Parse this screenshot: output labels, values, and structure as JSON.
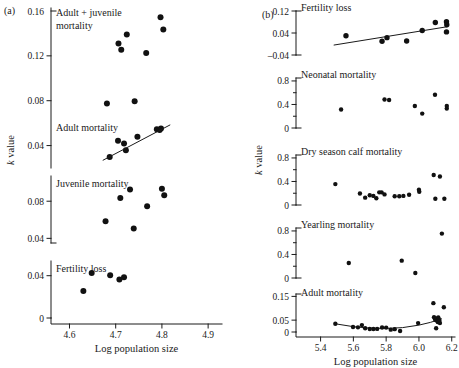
{
  "figure": {
    "panel_a_letter": "(a)",
    "panel_b_letter": "(b)",
    "y_axis_label_a": "k value",
    "y_axis_label_b": "k value",
    "x_axis_label_a": "Log population size",
    "x_axis_label_b": "Log population size"
  },
  "chart_data": [
    {
      "type": "scatter",
      "panel": "(a)",
      "title": "Adult + juvenile mortality",
      "xlabel": "Log population size",
      "ylabel": "k value",
      "xlim": [
        4.56,
        4.93
      ],
      "ylim": [
        0.02,
        0.16
      ],
      "xticks": [
        4.6,
        4.7,
        4.8,
        4.9
      ],
      "xtick_labels": [
        "4.6",
        "4.7",
        "4.8",
        "4.9"
      ],
      "yticks": [
        0.04,
        0.08,
        0.12,
        0.16
      ],
      "ytick_labels": [
        "0.04",
        "0.08",
        "0.12",
        "0.16"
      ],
      "grid": false,
      "legend": "none",
      "points": [
        {
          "x": 4.681,
          "y": 0.0775
        },
        {
          "x": 4.706,
          "y": 0.131
        },
        {
          "x": 4.712,
          "y": 0.1255
        },
        {
          "x": 4.724,
          "y": 0.139
        },
        {
          "x": 4.741,
          "y": 0.0795
        },
        {
          "x": 4.766,
          "y": 0.1225
        },
        {
          "x": 4.797,
          "y": 0.1545
        },
        {
          "x": 4.803,
          "y": 0.1435
        }
      ]
    },
    {
      "type": "scatter",
      "panel": "(a)",
      "title": "Adult mortality",
      "xlabel": "Log population size",
      "ylabel": "k value",
      "xlim": [
        4.56,
        4.93
      ],
      "ylim": [
        0.02,
        0.16
      ],
      "grid": false,
      "legend": "none",
      "trendline": {
        "x0": 4.672,
        "y0": 0.0268,
        "x1": 4.818,
        "y1": 0.0585
      },
      "points": [
        {
          "x": 4.687,
          "y": 0.0297
        },
        {
          "x": 4.705,
          "y": 0.0443
        },
        {
          "x": 4.718,
          "y": 0.0418
        },
        {
          "x": 4.722,
          "y": 0.0358
        },
        {
          "x": 4.747,
          "y": 0.0478
        },
        {
          "x": 4.789,
          "y": 0.0545
        },
        {
          "x": 4.795,
          "y": 0.0538
        },
        {
          "x": 4.798,
          "y": 0.0552
        }
      ]
    },
    {
      "type": "scatter",
      "panel": "(a)",
      "title": "Juvenile mortality",
      "xlabel": "Log population size",
      "ylabel": "k value",
      "xlim": [
        4.56,
        4.93
      ],
      "ylim": [
        0.04,
        0.105
      ],
      "yticks": [
        0.04,
        0.08
      ],
      "ytick_labels": [
        "0.04",
        "0.08"
      ],
      "grid": false,
      "legend": "none",
      "points": [
        {
          "x": 4.678,
          "y": 0.0585
        },
        {
          "x": 4.71,
          "y": 0.0835
        },
        {
          "x": 4.731,
          "y": 0.0925
        },
        {
          "x": 4.739,
          "y": 0.0505
        },
        {
          "x": 4.768,
          "y": 0.0745
        },
        {
          "x": 4.8,
          "y": 0.0935
        },
        {
          "x": 4.805,
          "y": 0.0865
        }
      ]
    },
    {
      "type": "scatter",
      "panel": "(a)",
      "title": "Fertility loss",
      "xlabel": "Log population size",
      "ylabel": "k value",
      "xlim": [
        4.56,
        4.93
      ],
      "ylim": [
        0,
        0.052
      ],
      "yticks": [
        0,
        0.04
      ],
      "ytick_labels": [
        "0",
        "0.04"
      ],
      "grid": false,
      "legend": "none",
      "points": [
        {
          "x": 4.63,
          "y": 0.0255
        },
        {
          "x": 4.648,
          "y": 0.0425
        },
        {
          "x": 4.688,
          "y": 0.0405
        },
        {
          "x": 4.708,
          "y": 0.0365
        },
        {
          "x": 4.718,
          "y": 0.0385
        }
      ]
    },
    {
      "type": "scatter",
      "panel": "(b)",
      "title": "Fertility loss",
      "xlabel": "Log population size",
      "ylabel": "k value",
      "xlim": [
        5.25,
        6.22
      ],
      "ylim": [
        -0.04,
        0.12
      ],
      "xticks": [
        5.4,
        5.6,
        5.8,
        6.0,
        6.2
      ],
      "xtick_labels": [
        "5.4",
        "5.6",
        "5.8",
        "6.0",
        "6.2"
      ],
      "yticks": [
        -0.04,
        0.04,
        0.12
      ],
      "ytick_labels": [
        "-0.04",
        "0.04",
        "0.12"
      ],
      "grid": false,
      "legend": "none",
      "trendline": {
        "x0": 5.48,
        "y0": -0.004,
        "x1": 6.175,
        "y1": 0.063
      },
      "points": [
        {
          "x": 5.555,
          "y": 0.03
        },
        {
          "x": 5.775,
          "y": 0.01
        },
        {
          "x": 5.805,
          "y": 0.023
        },
        {
          "x": 5.925,
          "y": 0.011
        },
        {
          "x": 6.02,
          "y": 0.049
        },
        {
          "x": 6.1,
          "y": 0.078
        },
        {
          "x": 6.168,
          "y": 0.081
        },
        {
          "x": 6.17,
          "y": 0.07
        },
        {
          "x": 6.168,
          "y": 0.044
        }
      ]
    },
    {
      "type": "scatter",
      "panel": "(b)",
      "title": "Neonatal mortality",
      "xlabel": "Log population size",
      "ylabel": "k value",
      "xlim": [
        5.25,
        6.22
      ],
      "ylim": [
        0,
        0.85
      ],
      "yticks": [
        0,
        0.4,
        0.8
      ],
      "ytick_labels": [
        "0",
        "0.4",
        "0.8"
      ],
      "grid": false,
      "legend": "none",
      "points": [
        {
          "x": 5.525,
          "y": 0.315
        },
        {
          "x": 5.79,
          "y": 0.485
        },
        {
          "x": 5.818,
          "y": 0.475
        },
        {
          "x": 5.975,
          "y": 0.375
        },
        {
          "x": 6.02,
          "y": 0.245
        },
        {
          "x": 6.098,
          "y": 0.565
        },
        {
          "x": 6.17,
          "y": 0.375
        },
        {
          "x": 6.17,
          "y": 0.33
        }
      ]
    },
    {
      "type": "scatter",
      "panel": "(b)",
      "title": "Dry season calf mortality",
      "xlabel": "Log population size",
      "ylabel": "k value",
      "xlim": [
        5.25,
        6.22
      ],
      "ylim": [
        0,
        0.85
      ],
      "yticks": [
        0,
        0.4,
        0.8
      ],
      "ytick_labels": [
        "0",
        "0.4",
        "0.8"
      ],
      "grid": false,
      "legend": "none",
      "points": [
        {
          "x": 5.49,
          "y": 0.355
        },
        {
          "x": 5.64,
          "y": 0.195
        },
        {
          "x": 5.672,
          "y": 0.125
        },
        {
          "x": 5.7,
          "y": 0.165
        },
        {
          "x": 5.722,
          "y": 0.155
        },
        {
          "x": 5.74,
          "y": 0.115
        },
        {
          "x": 5.758,
          "y": 0.215
        },
        {
          "x": 5.772,
          "y": 0.215
        },
        {
          "x": 5.79,
          "y": 0.18
        },
        {
          "x": 5.852,
          "y": 0.15
        },
        {
          "x": 5.88,
          "y": 0.15
        },
        {
          "x": 5.905,
          "y": 0.155
        },
        {
          "x": 5.94,
          "y": 0.175
        },
        {
          "x": 6.0,
          "y": 0.26
        },
        {
          "x": 6.002,
          "y": 0.225
        },
        {
          "x": 6.09,
          "y": 0.51
        },
        {
          "x": 6.128,
          "y": 0.485
        },
        {
          "x": 6.1,
          "y": 0.105
        },
        {
          "x": 6.155,
          "y": 0.105
        }
      ]
    },
    {
      "type": "scatter",
      "panel": "(b)",
      "title": "Yearling mortality",
      "xlabel": "Log population size",
      "ylabel": "k value",
      "xlim": [
        5.25,
        6.22
      ],
      "ylim": [
        0,
        0.85
      ],
      "yticks": [
        0,
        0.4,
        0.8
      ],
      "ytick_labels": [
        "0",
        "0.4",
        "0.8"
      ],
      "grid": false,
      "legend": "none",
      "points": [
        {
          "x": 5.572,
          "y": 0.255
        },
        {
          "x": 5.895,
          "y": 0.295
        },
        {
          "x": 5.978,
          "y": 0.085
        },
        {
          "x": 6.14,
          "y": 0.755
        }
      ]
    },
    {
      "type": "scatter",
      "panel": "(b)",
      "title": "Adult mortality",
      "xlabel": "Log population size",
      "ylabel": "k value",
      "xlim": [
        5.25,
        6.22
      ],
      "ylim": [
        0,
        0.16
      ],
      "yticks": [
        0,
        0.05,
        0.15
      ],
      "ytick_labels": [
        "0",
        "0.05",
        "0.15"
      ],
      "grid": false,
      "legend": "none",
      "curve": [
        {
          "x": 5.49,
          "y": 0.0345
        },
        {
          "x": 5.6,
          "y": 0.0225
        },
        {
          "x": 5.7,
          "y": 0.0165
        },
        {
          "x": 5.8,
          "y": 0.015
        },
        {
          "x": 5.9,
          "y": 0.0185
        },
        {
          "x": 6.0,
          "y": 0.029
        },
        {
          "x": 6.07,
          "y": 0.0405
        },
        {
          "x": 6.14,
          "y": 0.056
        }
      ],
      "points": [
        {
          "x": 5.49,
          "y": 0.0345
        },
        {
          "x": 5.598,
          "y": 0.021
        },
        {
          "x": 5.628,
          "y": 0.0195
        },
        {
          "x": 5.652,
          "y": 0.029
        },
        {
          "x": 5.672,
          "y": 0.0155
        },
        {
          "x": 5.7,
          "y": 0.0125
        },
        {
          "x": 5.722,
          "y": 0.0125
        },
        {
          "x": 5.745,
          "y": 0.013
        },
        {
          "x": 5.775,
          "y": 0.019
        },
        {
          "x": 5.8,
          "y": 0.0185
        },
        {
          "x": 5.828,
          "y": 0.01
        },
        {
          "x": 5.852,
          "y": 0.012
        },
        {
          "x": 5.885,
          "y": 0.0045
        },
        {
          "x": 5.995,
          "y": 0.0375
        },
        {
          "x": 6.088,
          "y": 0.1215
        },
        {
          "x": 6.092,
          "y": 0.062
        },
        {
          "x": 6.098,
          "y": 0.0545
        },
        {
          "x": 6.102,
          "y": 0.0505
        },
        {
          "x": 6.108,
          "y": 0.0575
        },
        {
          "x": 6.112,
          "y": 0.047
        },
        {
          "x": 6.115,
          "y": 0.042
        },
        {
          "x": 6.118,
          "y": 0.061
        },
        {
          "x": 6.122,
          "y": 0.053
        },
        {
          "x": 6.125,
          "y": 0.047
        },
        {
          "x": 6.128,
          "y": 0.0375
        },
        {
          "x": 6.105,
          "y": 0.0155
        },
        {
          "x": 6.152,
          "y": 0.1045
        }
      ]
    }
  ]
}
